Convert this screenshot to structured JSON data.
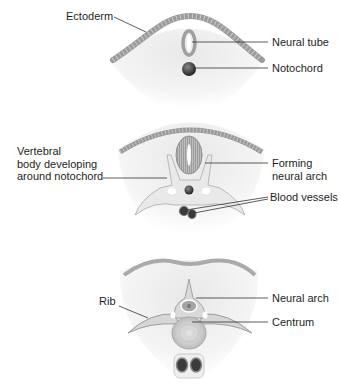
{
  "diagram": {
    "type": "embryology-cross-sections",
    "panels": [
      {
        "id": "stage-1",
        "labels": {
          "ectoderm": "Ectoderm",
          "neural_tube": "Neural tube",
          "notochord": "Notochord"
        }
      },
      {
        "id": "stage-2",
        "labels": {
          "vertebral_body_line1": "Vertebral",
          "vertebral_body_line2": "body developing",
          "vertebral_body_line3": "around notochord",
          "forming_neural_arch_line1": "Forming",
          "forming_neural_arch_line2": "neural arch",
          "blood_vessels": "Blood vessels"
        }
      },
      {
        "id": "stage-3",
        "labels": {
          "rib": "Rib",
          "neural_arch": "Neural arch",
          "centrum": "Centrum"
        }
      }
    ],
    "colors": {
      "background": "#ffffff",
      "ectoderm": "#9a9a9a",
      "tissue": "#ececec",
      "bone": "#dadada",
      "notochord": "#3a3a3a",
      "leader_line": "#333333",
      "text": "#1e1e1e"
    }
  }
}
